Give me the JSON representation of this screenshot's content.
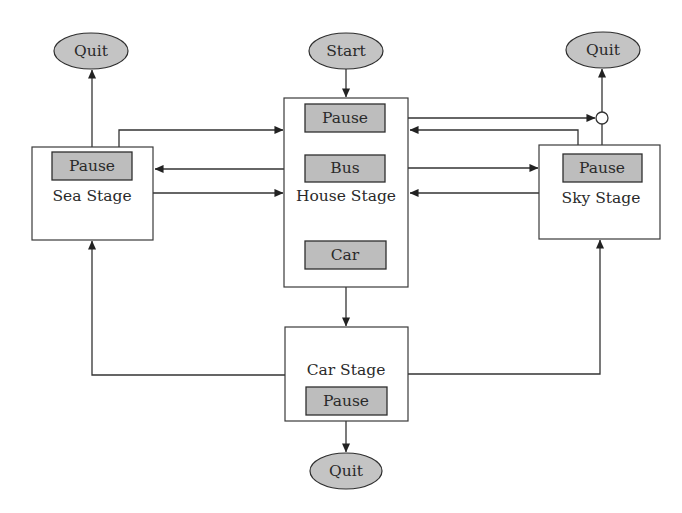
{
  "diagram": {
    "type": "state-flow",
    "colors": {
      "stage_fill": "#ffffff",
      "button_fill": "#bdbdbd",
      "terminal_fill": "#c4c4c4",
      "line": "#333333"
    },
    "terminals": {
      "start": {
        "label": "Start"
      },
      "quit_sea": {
        "label": "Quit"
      },
      "quit_sky": {
        "label": "Quit"
      },
      "quit_car": {
        "label": "Quit"
      }
    },
    "stages": {
      "sea": {
        "label": "Sea Stage",
        "buttons": [
          {
            "label": "Pause"
          }
        ]
      },
      "house": {
        "label": "House Stage",
        "buttons": [
          {
            "label": "Pause"
          },
          {
            "label": "Bus"
          },
          {
            "label": "Car"
          }
        ]
      },
      "sky": {
        "label": "Sky Stage",
        "buttons": [
          {
            "label": "Pause"
          }
        ]
      },
      "car": {
        "label": "Car Stage",
        "buttons": [
          {
            "label": "Pause"
          }
        ]
      }
    },
    "edges": [
      {
        "from": "Start",
        "to": "House Stage"
      },
      {
        "from": "Sea Stage.Pause",
        "to": "Quit (top-left)"
      },
      {
        "from": "Sea Stage.Pause",
        "to": "House Stage"
      },
      {
        "from": "House Stage.Bus",
        "to": "Sea Stage"
      },
      {
        "from": "Sea Stage",
        "to": "House Stage"
      },
      {
        "from": "House Stage.Pause",
        "to": "junction"
      },
      {
        "from": "Sky Stage.Pause",
        "to": "junction"
      },
      {
        "from": "junction",
        "to": "Quit (top-right)"
      },
      {
        "from": "Sky Stage.Pause",
        "to": "House Stage"
      },
      {
        "from": "House Stage.Bus",
        "to": "Sky Stage"
      },
      {
        "from": "Sky Stage",
        "to": "House Stage"
      },
      {
        "from": "House Stage.Car",
        "to": "Car Stage"
      },
      {
        "from": "Car Stage",
        "to": "Sea Stage"
      },
      {
        "from": "Car Stage",
        "to": "Sky Stage"
      },
      {
        "from": "Car Stage.Pause",
        "to": "Quit (bottom)"
      }
    ]
  }
}
